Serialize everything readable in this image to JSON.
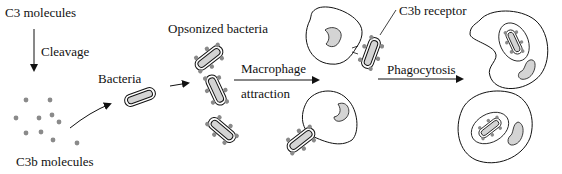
{
  "diagram": {
    "labels": {
      "c3_molecules": "C3 molecules",
      "cleavage": "Cleavage",
      "c3b_molecules": "C3b molecules",
      "bacteria": "Bacteria",
      "opsonized_bacteria": "Opsonized bacteria",
      "macrophage": "Macrophage",
      "attraction": "attraction",
      "c3b_receptor": "C3b receptor",
      "phagocytosis": "Phagocytosis"
    },
    "colors": {
      "dot": "#8a8a8a",
      "fill": "#d4d4d4",
      "stroke": "#111111"
    }
  }
}
